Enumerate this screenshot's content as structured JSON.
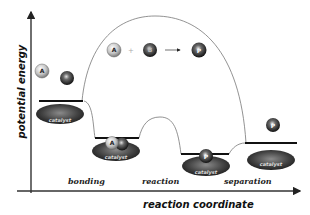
{
  "diagram": {
    "y_axis_label": "potential energy",
    "x_axis_label": "reaction coordinate",
    "stages": [
      {
        "label": "bonding"
      },
      {
        "label": "reaction"
      },
      {
        "label": "separation"
      }
    ],
    "catalyst_label": "catalyst",
    "equation": {
      "reactant_a": "A",
      "plus": "+",
      "reactant_b": "B",
      "arrow": "→",
      "product": "P"
    },
    "molecules": {
      "a": "A",
      "b": "B",
      "p": "P"
    },
    "colors": {
      "line": "#111111",
      "curve": "#777777",
      "catalyst": "#3a3a3a",
      "molecule_light": "#c8c8c8",
      "molecule_dark": "#333333"
    }
  }
}
